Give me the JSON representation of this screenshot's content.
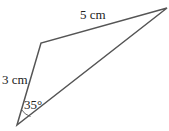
{
  "diagram": {
    "type": "triangle",
    "stroke_color": "#555555",
    "vertices": {
      "bottom": [
        17,
        125
      ],
      "top_left": [
        41,
        43
      ],
      "top_right": [
        167,
        8
      ]
    },
    "labels": {
      "top_side": "5 cm",
      "left_side": "3 cm",
      "angle": "35°"
    }
  }
}
